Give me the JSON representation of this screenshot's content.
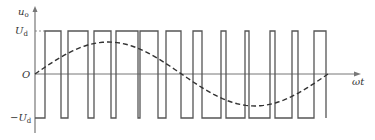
{
  "diagram": {
    "type": "spwm-waveform",
    "labels": {
      "y_axis": "u",
      "y_axis_sub": "o",
      "x_axis": "ωt",
      "origin": "O",
      "pos_level": "U",
      "pos_level_sub": "d",
      "neg_level": "−U",
      "neg_level_sub": "d"
    },
    "colors": {
      "line": "#555555",
      "axis": "#777777",
      "text": "#333333"
    },
    "geometry": {
      "axis_x": 35,
      "zero_y": 74,
      "top_y": 31,
      "bottom_y": 118,
      "x_axis_end": 330,
      "y_axis_top": 6,
      "y_axis_bottom": 133
    },
    "pulse_edges_x": [
      45,
      61,
      68,
      88,
      94,
      111,
      116,
      138,
      140,
      158,
      166,
      181,
      193,
      202,
      221,
      226,
      245,
      249,
      270,
      275,
      292,
      298,
      314,
      326
    ],
    "sine": {
      "x_start": 35,
      "x_end": 328,
      "amplitude_px": 32,
      "phase": "0-to-2pi"
    }
  }
}
